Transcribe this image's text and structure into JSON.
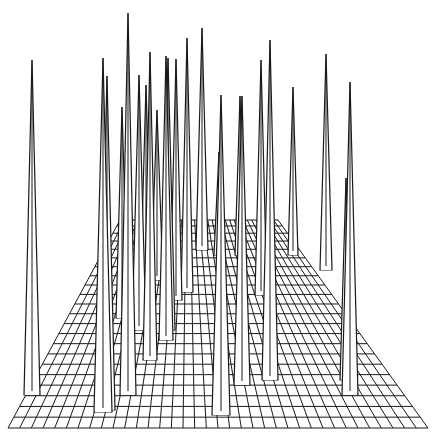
{
  "chart_data": {
    "type": "surface-3d-wireframe",
    "title": "",
    "xlabel": "",
    "ylabel": "",
    "zlabel": "",
    "grid": true,
    "axes_visible": false,
    "legend": null,
    "colors": {
      "line": "#1a1a1a",
      "background": "#ffffff"
    },
    "plane": {
      "front_y": 428,
      "front_x0": 8,
      "front_x1": 428,
      "back_y": 220,
      "back_x0": 120,
      "back_x1": 278,
      "columns": 36,
      "rows": 22
    },
    "spikes": [
      {
        "x": 32,
        "top": 60,
        "base_y": 395,
        "half_width": 8
      },
      {
        "x": 103,
        "top": 58,
        "base_y": 412,
        "half_width": 9
      },
      {
        "x": 107,
        "top": 76,
        "base_y": 410,
        "half_width": 8
      },
      {
        "x": 122,
        "top": 107,
        "base_y": 318,
        "half_width": 6
      },
      {
        "x": 128,
        "top": 13,
        "base_y": 395,
        "half_width": 8
      },
      {
        "x": 139,
        "top": 75,
        "base_y": 330,
        "half_width": 7
      },
      {
        "x": 146,
        "top": 85,
        "base_y": 300,
        "half_width": 6
      },
      {
        "x": 150,
        "top": 52,
        "base_y": 360,
        "half_width": 7
      },
      {
        "x": 157,
        "top": 110,
        "base_y": 280,
        "half_width": 6
      },
      {
        "x": 166,
        "top": 56,
        "base_y": 340,
        "half_width": 7
      },
      {
        "x": 168,
        "top": 58,
        "base_y": 330,
        "half_width": 7
      },
      {
        "x": 176,
        "top": 59,
        "base_y": 300,
        "half_width": 6
      },
      {
        "x": 187,
        "top": 38,
        "base_y": 292,
        "half_width": 6
      },
      {
        "x": 202,
        "top": 28,
        "base_y": 250,
        "half_width": 6
      },
      {
        "x": 219,
        "top": 152,
        "base_y": 255,
        "half_width": 5
      },
      {
        "x": 221,
        "top": 95,
        "base_y": 415,
        "half_width": 9
      },
      {
        "x": 240,
        "top": 96,
        "base_y": 255,
        "half_width": 5
      },
      {
        "x": 242,
        "top": 96,
        "base_y": 385,
        "half_width": 8
      },
      {
        "x": 261,
        "top": 60,
        "base_y": 295,
        "half_width": 6
      },
      {
        "x": 270,
        "top": 40,
        "base_y": 380,
        "half_width": 8
      },
      {
        "x": 293,
        "top": 87,
        "base_y": 255,
        "half_width": 5
      },
      {
        "x": 326,
        "top": 54,
        "base_y": 270,
        "half_width": 6
      },
      {
        "x": 346,
        "top": 178,
        "base_y": 380,
        "half_width": 6
      },
      {
        "x": 350,
        "top": 82,
        "base_y": 395,
        "half_width": 8
      }
    ]
  }
}
